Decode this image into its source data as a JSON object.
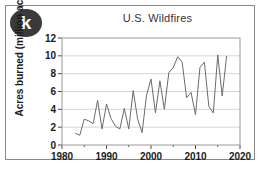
{
  "badge": {
    "label": "k"
  },
  "chart_data": {
    "type": "line",
    "title": "U.S. Wildfires",
    "xlabel": "",
    "ylabel": "Acres burned (million acres)",
    "xlim": [
      1980,
      2020
    ],
    "ylim": [
      0,
      12
    ],
    "xticks": [
      1980,
      1990,
      2000,
      2010,
      2020
    ],
    "xticks_minor": [
      1985,
      1995,
      2005,
      2015
    ],
    "yticks": [
      0,
      2,
      4,
      6,
      8,
      10,
      12
    ],
    "grid": "horizontal",
    "legend": "none",
    "line_color": "#6b6b6b",
    "x": [
      1983,
      1984,
      1985,
      1986,
      1987,
      1988,
      1989,
      1990,
      1991,
      1992,
      1993,
      1994,
      1995,
      1996,
      1997,
      1998,
      1999,
      2000,
      2001,
      2002,
      2003,
      2004,
      2005,
      2006,
      2007,
      2008,
      2009,
      2010,
      2011,
      2012,
      2013,
      2014,
      2015,
      2016,
      2017
    ],
    "values": [
      1.3,
      1.1,
      2.9,
      2.7,
      2.4,
      5.0,
      1.8,
      4.6,
      3.0,
      2.1,
      1.8,
      4.1,
      1.8,
      6.1,
      2.9,
      1.4,
      5.6,
      7.4,
      3.6,
      7.2,
      4.0,
      8.1,
      8.7,
      9.9,
      9.3,
      5.3,
      5.9,
      3.4,
      8.7,
      9.3,
      4.3,
      3.6,
      10.1,
      5.5,
      10.0
    ],
    "tick_labels_x": [
      "1980",
      "1990",
      "2000",
      "2010",
      "2020"
    ],
    "tick_labels_y": [
      "0",
      "2",
      "4",
      "6",
      "8",
      "10",
      "12"
    ]
  }
}
